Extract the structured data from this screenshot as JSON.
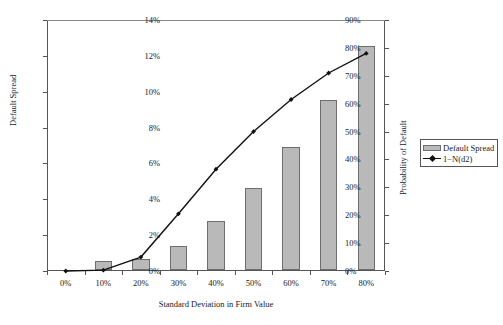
{
  "chart_data": {
    "type": "bar",
    "title": "",
    "xlabel": "Standard Deviation in Firm Value",
    "categories": [
      "0%",
      "10%",
      "20%",
      "30%",
      "40%",
      "50%",
      "60%",
      "70%",
      "80%"
    ],
    "grid": false,
    "legend_position": "right",
    "left_axis": {
      "label": "Default Spread",
      "ticks": [
        "0%",
        "2%",
        "4%",
        "6%",
        "8%",
        "10%",
        "12%",
        "14%"
      ],
      "tick_values": [
        0,
        2,
        4,
        6,
        8,
        10,
        12,
        14
      ],
      "ylim": [
        0,
        14
      ]
    },
    "right_axis": {
      "label": "Probability of Default",
      "ticks": [
        "0%",
        "10%",
        "20%",
        "30%",
        "40%",
        "50%",
        "60%",
        "70%",
        "80%",
        "90%"
      ],
      "tick_values": [
        0,
        10,
        20,
        30,
        40,
        50,
        60,
        70,
        80,
        90
      ],
      "ylim": [
        0,
        90
      ]
    },
    "series": [
      {
        "name": "Default Spread",
        "type": "bar",
        "axis": "left",
        "color": "#b9b9b9",
        "edge_color": "#6e6e6e",
        "values": [
          0.0,
          0.5,
          0.6,
          1.35,
          2.75,
          4.6,
          6.85,
          9.5,
          12.5
        ]
      },
      {
        "name": "1−N(d2)",
        "type": "line",
        "axis": "right",
        "color": "#111111",
        "marker": "diamond",
        "values": [
          0.0,
          0.3,
          5.0,
          20.5,
          36.5,
          50.0,
          61.5,
          71.0,
          78.0
        ]
      }
    ]
  },
  "legend": {
    "items": [
      {
        "label": "Default Spread",
        "marker": "bar-swatch"
      },
      {
        "label": "1−N(d2)",
        "marker": "line-diamond-swatch"
      }
    ]
  },
  "colors": {
    "bar_fill": "#b9b9b9",
    "bar_edge": "#6e6e6e",
    "line": "#111111",
    "axis": "#555555",
    "text": "#1a1a1a",
    "background": "#ffffff"
  }
}
